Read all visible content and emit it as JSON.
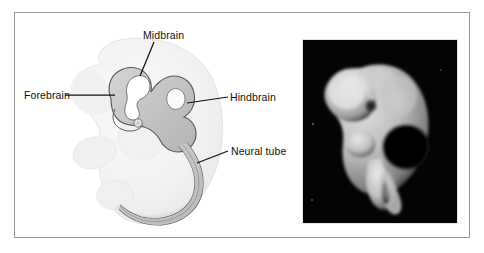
{
  "figure": {
    "background_color": "#ffffff",
    "frame_border_color": "#9a9a9a"
  },
  "diagram": {
    "name": "embryo-line-drawing",
    "labels": [
      {
        "id": "midbrain",
        "text": "Midbrain",
        "leader": "line from label down-left to the dorsal bend of the mesencephalon"
      },
      {
        "id": "forebrain",
        "text": "Forebrain",
        "leader": "horizontal line from label right to the prosencephalon"
      },
      {
        "id": "hindbrain",
        "text": "Hindbrain",
        "leader": "horizontal line from label left to the rhombencephalon"
      },
      {
        "id": "neural-tube",
        "text": "Neural tube",
        "leader": "horizontal line from label left to the dorsal neural tube along the back"
      }
    ],
    "colors": {
      "body_fill": "#f2f2f2",
      "neural_tube_fill": "#c9c9c9",
      "outline": "#555555",
      "label_text": "#111111"
    }
  },
  "photograph": {
    "name": "embryo-photograph",
    "description": "Black-and-white photomicrograph of a whole curled embryo on a black background, head to upper left, limb buds and tail toward lower right",
    "background_color": "#040404",
    "specimen_color": "#d8d8d8"
  }
}
